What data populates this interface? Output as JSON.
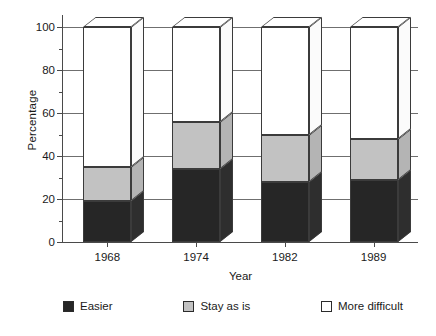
{
  "chart_data": {
    "type": "bar",
    "subtype": "stacked-3d-column",
    "title": "",
    "xlabel": "Year",
    "ylabel": "Percentage",
    "categories": [
      "1968",
      "1974",
      "1982",
      "1989"
    ],
    "ylim": [
      0,
      100
    ],
    "y_ticks": [
      0,
      20,
      40,
      60,
      80,
      100
    ],
    "y_minor_ticks": [
      10,
      30,
      50,
      70,
      90
    ],
    "grid": true,
    "grid_axis": "y",
    "legend_position": "bottom",
    "stacked_total": 100,
    "series": [
      {
        "name": "Easier",
        "color": "#262626",
        "values": [
          19,
          34,
          28,
          29
        ]
      },
      {
        "name": "Stay as is",
        "color": "#c2c2c2",
        "values": [
          16,
          22,
          22,
          19
        ]
      },
      {
        "name": "More difficult",
        "color": "#ffffff",
        "values": [
          65,
          44,
          50,
          52
        ]
      }
    ],
    "cumulative_tops": [
      {
        "category": "1968",
        "easier": 19,
        "stay_top": 35,
        "total": 100
      },
      {
        "category": "1974",
        "easier": 34,
        "stay_top": 56,
        "total": 100
      },
      {
        "category": "1982",
        "easier": 28,
        "stay_top": 50,
        "total": 100
      },
      {
        "category": "1989",
        "easier": 29,
        "stay_top": 48,
        "total": 100
      }
    ]
  },
  "axes": {
    "y_title": "Percentage",
    "x_title": "Year",
    "y_tick_labels": [
      "0",
      "20",
      "40",
      "60",
      "80",
      "100"
    ],
    "x_tick_labels": [
      "1968",
      "1974",
      "1982",
      "1989"
    ]
  },
  "legend": {
    "items": [
      {
        "label": "Easier",
        "swatch": "easier"
      },
      {
        "label": "Stay as is",
        "swatch": "stay"
      },
      {
        "label": "More difficult",
        "swatch": "more"
      }
    ]
  }
}
